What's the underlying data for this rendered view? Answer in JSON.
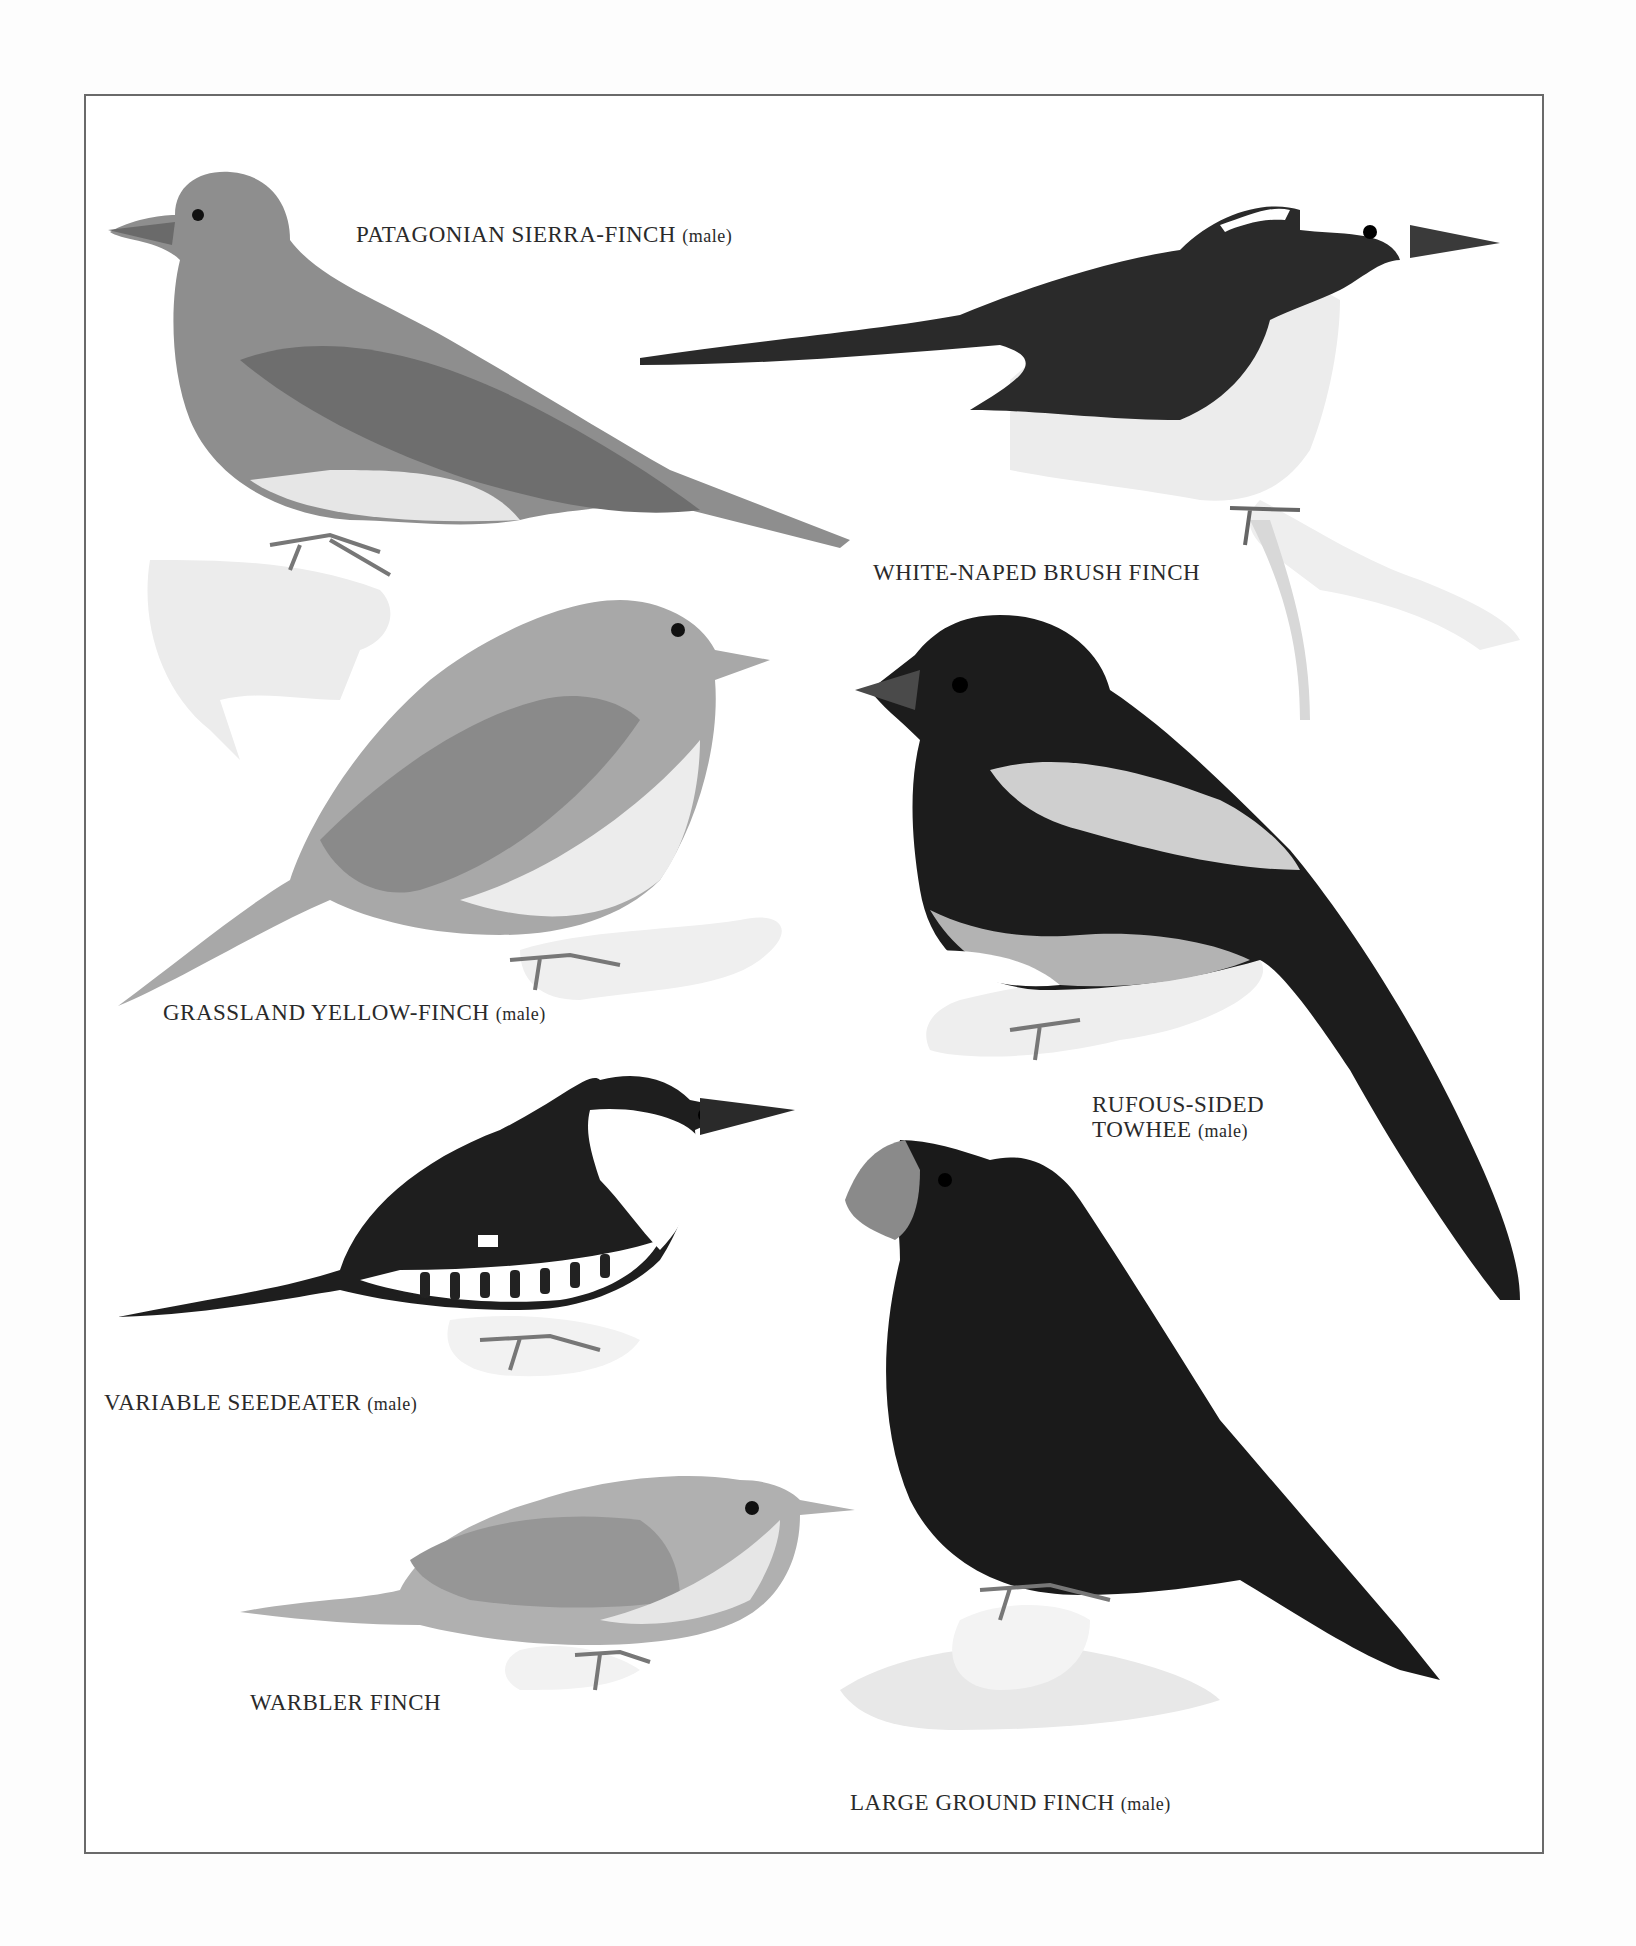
{
  "plate": {
    "frame": {
      "x": 84,
      "y": 94,
      "w": 1460,
      "h": 1760,
      "border_color": "#6a6a6a"
    },
    "birds": [
      {
        "name": "PATAGONIAN SIERRA-FINCH",
        "qualifier": "(male)",
        "tone": "#8e8e8e"
      },
      {
        "name": "WHITE-NAPED BRUSH FINCH",
        "qualifier": "",
        "tone": "#2a2a2a"
      },
      {
        "name": "GRASSLAND YELLOW-FINCH",
        "qualifier": "(male)",
        "tone": "#a8a8a8"
      },
      {
        "name_line1": "RUFOUS-SIDED",
        "name_line2": "TOWHEE",
        "qualifier": "(male)",
        "tone": "#1c1c1c"
      },
      {
        "name": "VARIABLE SEEDEATER",
        "qualifier": "(male)",
        "tone": "#1e1e1e"
      },
      {
        "name": "WARBLER FINCH",
        "qualifier": "",
        "tone": "#b0b0b0"
      },
      {
        "name": "LARGE GROUND FINCH",
        "qualifier": "(male)",
        "tone": "#1a1a1a"
      }
    ]
  }
}
